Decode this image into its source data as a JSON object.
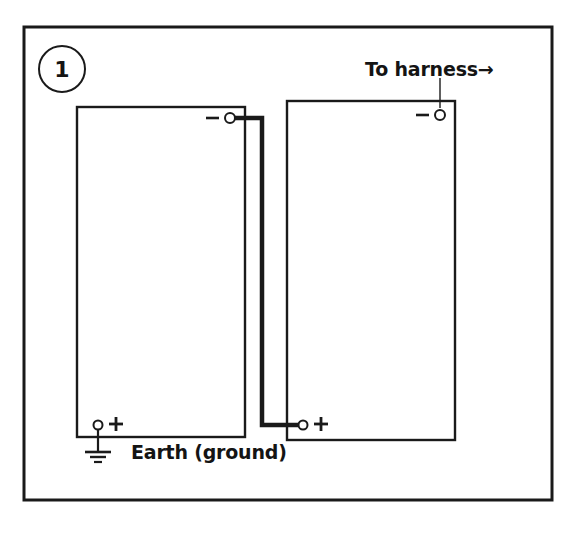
{
  "diagram": {
    "step_number": "1",
    "ink_color": "#1a1a1a",
    "background_color": "#ffffff",
    "labels": {
      "to_harness": "To harness→",
      "earth_ground": "Earth (ground)"
    },
    "terminals": [
      {
        "id": "left-battery-negative",
        "sign": "−",
        "x": 230,
        "y": 118,
        "sign_x": 212,
        "sign_y": 118
      },
      {
        "id": "left-battery-positive",
        "sign": "+",
        "x": 98,
        "y": 425,
        "sign_x": 115,
        "sign_y": 423
      },
      {
        "id": "right-battery-negative",
        "sign": "−",
        "x": 440,
        "y": 115,
        "sign_x": 422,
        "sign_y": 115
      },
      {
        "id": "right-battery-positive",
        "sign": "+",
        "x": 303,
        "y": 425,
        "sign_x": 320,
        "sign_y": 423
      }
    ],
    "batteries": [
      {
        "id": "left-battery",
        "x": 77,
        "y": 107,
        "width": 168,
        "height": 330
      },
      {
        "id": "right-battery",
        "x": 287,
        "y": 101,
        "width": 168,
        "height": 339
      }
    ],
    "frame": {
      "x": 24,
      "y": 27,
      "width": 528,
      "height": 473
    },
    "jumper_wire": {
      "id": "negative-to-positive-jumper",
      "points": "230,118 262,118 262,425 303,425"
    },
    "harness_leader": {
      "id": "harness-leader-line",
      "x": 440,
      "y_top": 78,
      "y_bottom": 108
    },
    "ground_symbol": {
      "id": "earth-ground-symbol",
      "stem_x": 98,
      "stem_top": 425,
      "stem_bottom": 452,
      "bars": [
        {
          "width": 26,
          "y": 452
        },
        {
          "width": 16,
          "y": 457
        },
        {
          "width": 8,
          "y": 462
        }
      ]
    }
  }
}
